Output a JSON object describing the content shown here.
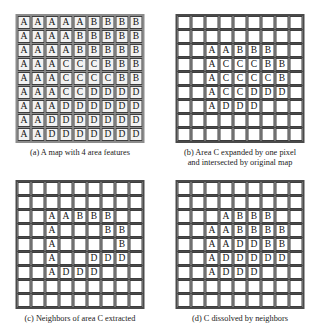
{
  "figure": {
    "grid_size": 9,
    "symbols": [
      "A",
      "B",
      "C",
      "D"
    ],
    "panels": [
      {
        "id": "a",
        "caption": "(a) A map with 4 area features",
        "caption_line2": "",
        "shaded": true,
        "rows": [
          [
            "A",
            "A",
            "A",
            "A",
            "A",
            "B",
            "B",
            "B",
            "B"
          ],
          [
            "A",
            "A",
            "A",
            "A",
            "B",
            "B",
            "B",
            "B",
            "B"
          ],
          [
            "A",
            "A",
            "A",
            "A",
            "B",
            "B",
            "B",
            "B",
            "B"
          ],
          [
            "A",
            "A",
            "A",
            "C",
            "C",
            "C",
            "B",
            "B",
            "B"
          ],
          [
            "A",
            "A",
            "A",
            "C",
            "C",
            "C",
            "C",
            "B",
            "B"
          ],
          [
            "A",
            "A",
            "A",
            "C",
            "C",
            "D",
            "D",
            "D",
            "D"
          ],
          [
            "A",
            "A",
            "A",
            "D",
            "D",
            "D",
            "D",
            "D",
            "D"
          ],
          [
            "A",
            "A",
            "D",
            "D",
            "D",
            "D",
            "D",
            "D",
            "D"
          ],
          [
            "A",
            "A",
            "D",
            "D",
            "D",
            "D",
            "D",
            "D",
            "D"
          ]
        ]
      },
      {
        "id": "b",
        "caption": "(b) Area C expanded by one pixel",
        "caption_line2": "and intersected by original map",
        "shaded": false,
        "rows": [
          [
            "",
            "",
            "",
            "",
            "",
            "",
            "",
            "",
            ""
          ],
          [
            "",
            "",
            "",
            "",
            "",
            "",
            "",
            "",
            ""
          ],
          [
            "",
            "",
            "A",
            "A",
            "B",
            "B",
            "B",
            "",
            ""
          ],
          [
            "",
            "",
            "A",
            "C",
            "C",
            "C",
            "B",
            "B",
            ""
          ],
          [
            "",
            "",
            "A",
            "C",
            "C",
            "C",
            "C",
            "B",
            ""
          ],
          [
            "",
            "",
            "A",
            "C",
            "C",
            "D",
            "D",
            "D",
            ""
          ],
          [
            "",
            "",
            "A",
            "D",
            "D",
            "D",
            "",
            "",
            ""
          ],
          [
            "",
            "",
            "",
            "",
            "",
            "",
            "",
            "",
            ""
          ],
          [
            "",
            "",
            "",
            "",
            "",
            "",
            "",
            "",
            ""
          ]
        ]
      },
      {
        "id": "c",
        "caption": "(c) Neighbors of area C extracted",
        "caption_line2": "",
        "shaded": false,
        "rows": [
          [
            "",
            "",
            "",
            "",
            "",
            "",
            "",
            "",
            ""
          ],
          [
            "",
            "",
            "",
            "",
            "",
            "",
            "",
            "",
            ""
          ],
          [
            "",
            "",
            "A",
            "A",
            "B",
            "B",
            "B",
            "",
            ""
          ],
          [
            "",
            "",
            "A",
            "",
            "",
            "",
            "B",
            "B",
            ""
          ],
          [
            "",
            "",
            "A",
            "",
            "",
            "",
            "",
            "B",
            ""
          ],
          [
            "",
            "",
            "A",
            "",
            "",
            "D",
            "D",
            "D",
            ""
          ],
          [
            "",
            "",
            "A",
            "D",
            "D",
            "D",
            "",
            "",
            ""
          ],
          [
            "",
            "",
            "",
            "",
            "",
            "",
            "",
            "",
            ""
          ],
          [
            "",
            "",
            "",
            "",
            "",
            "",
            "",
            "",
            ""
          ]
        ]
      },
      {
        "id": "d",
        "caption": "(d) C dissolved by neighbors",
        "caption_line2": "",
        "shaded": false,
        "rows": [
          [
            "",
            "",
            "",
            "",
            "",
            "",
            "",
            "",
            ""
          ],
          [
            "",
            "",
            "",
            "",
            "",
            "",
            "",
            "",
            ""
          ],
          [
            "",
            "",
            "",
            "A",
            "B",
            "B",
            "B",
            "",
            ""
          ],
          [
            "",
            "",
            "A",
            "A",
            "B",
            "B",
            "B",
            "B",
            ""
          ],
          [
            "",
            "",
            "A",
            "A",
            "D",
            "D",
            "B",
            "B",
            ""
          ],
          [
            "",
            "",
            "A",
            "D",
            "D",
            "D",
            "D",
            "D",
            ""
          ],
          [
            "",
            "",
            "A",
            "D",
            "D",
            "D",
            "",
            "",
            ""
          ],
          [
            "",
            "",
            "",
            "",
            "",
            "",
            "",
            "",
            ""
          ],
          [
            "",
            "",
            "",
            "",
            "",
            "",
            "",
            "",
            ""
          ]
        ]
      }
    ]
  }
}
